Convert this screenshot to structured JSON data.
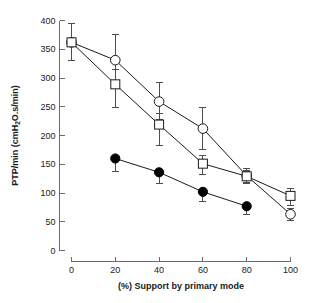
{
  "chart_data": {
    "type": "line",
    "title": "",
    "xlabel": "(%) Support by primary mode",
    "ylabel": "PTP/min (cmH",
    "ylabel_sub": "2",
    "ylabel_rest": "O.s/min)",
    "ylabel_full": "PTP/min (cmH2O.s/min)",
    "x": [
      0,
      20,
      40,
      60,
      80,
      100
    ],
    "xlim": [
      0,
      100
    ],
    "ylim": [
      0,
      400
    ],
    "xticks": [
      "0",
      "20",
      "40",
      "60",
      "80",
      "100"
    ],
    "yticks": [
      "0",
      "50",
      "100",
      "150",
      "200",
      "250",
      "300",
      "350",
      "400"
    ],
    "grid": false,
    "legend": "none",
    "series": [
      {
        "name": "open-circle-series",
        "marker": "open-circle",
        "x": [
          0,
          20,
          40,
          60,
          80,
          100
        ],
        "values": [
          362,
          331,
          259,
          212,
          130,
          63
        ],
        "err_upper": [
          33,
          44,
          33,
          37,
          12,
          10
        ],
        "err_lower": [
          31,
          44,
          31,
          37,
          12,
          10
        ]
      },
      {
        "name": "open-square-series",
        "marker": "open-square",
        "x": [
          0,
          20,
          40,
          60,
          80,
          100
        ],
        "values": [
          362,
          289,
          219,
          151,
          129,
          95
        ],
        "err_upper": [
          33,
          26,
          20,
          14,
          11,
          13
        ],
        "err_lower": [
          31,
          41,
          36,
          19,
          13,
          16
        ]
      },
      {
        "name": "filled-circle-series",
        "marker": "filled-circle",
        "x": [
          20,
          40,
          60,
          80
        ],
        "values": [
          160,
          136,
          102,
          77
        ],
        "err_upper": [
          0,
          0,
          0,
          0
        ],
        "err_lower": [
          23,
          20,
          16,
          14
        ]
      }
    ]
  },
  "colors": {
    "axis": "#6b6b6b",
    "text": "#1a1a1a",
    "line": "#1a1a1a",
    "errorbar": "#4d4d4d",
    "marker_fill_open": "#ffffff",
    "marker_fill_solid": "#000000",
    "background": "#ffffff"
  }
}
